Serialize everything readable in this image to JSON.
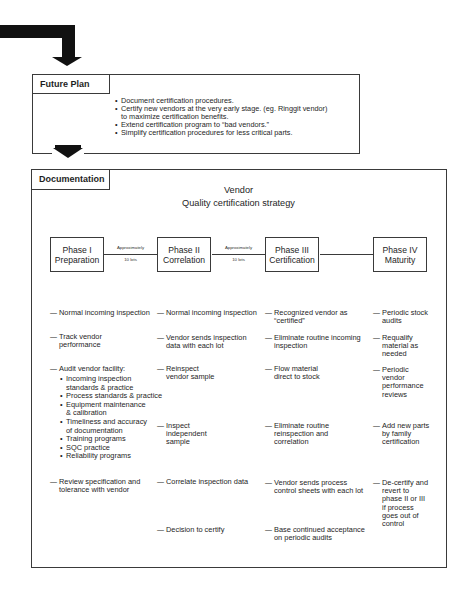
{
  "future_plan": {
    "label": "Future Plan",
    "bullets": [
      "Document certification procedures.",
      "Certify new vendors at the very early stage. (eg. Ringgit vendor)\nto maximize certification benefits.",
      "Extend certification program to “bad vendors.”",
      "Simplify certification procedures for less critical parts."
    ]
  },
  "documentation": {
    "label": "Documentation",
    "title_line1": "Vendor",
    "title_line2": "Quality certification strategy",
    "phases": [
      {
        "name": "Phase I",
        "subtitle": "Preparation"
      },
      {
        "name": "Phase II",
        "subtitle": "Correlation"
      },
      {
        "name": "Phase III",
        "subtitle": "Certification"
      },
      {
        "name": "Phase IV",
        "subtitle": "Maturity"
      }
    ],
    "transitions": [
      {
        "top": "Approximately",
        "bottom": "10 lots"
      },
      {
        "top": "Approximately",
        "bottom": "10 lots"
      }
    ],
    "columns": {
      "phase1": {
        "items": [
          "Normal incoming inspection",
          "Track vendor\nperformance",
          "Audit vendor facility:",
          "Review specification and\ntolerance with vendor"
        ],
        "audit_subitems": [
          "Incoming inspection\nstandards & practice",
          "Process standards & practice",
          "Equipment maintenance\n& calibration",
          "Timeliness and accuracy\nof documentation",
          "Training programs",
          "SQC practice",
          "Reliability programs"
        ]
      },
      "phase2": {
        "items": [
          "Normal incoming inspection",
          "Vendor sends inspection\ndata with each lot",
          "Reinspect\nvendor sample",
          "Inspect\nindependent\nsample",
          "Correlate inspection data",
          "Decision to certify"
        ]
      },
      "phase3": {
        "items": [
          "Recognized vendor as\n“certified”",
          "Eliminate routine incoming\ninspection",
          "Flow material\ndirect to stock",
          "Eliminate routine\nreinspection and\ncorrelation",
          "Vendor sends process\ncontrol sheets with each lot",
          "Base continued acceptance\non periodic audits"
        ]
      },
      "phase4": {
        "items": [
          "Periodic stock\naudits",
          "Requalify\nmaterial as\nneeded",
          "Periodic\nvendor\nperformance\nreviews",
          "Add new parts\nby family\ncertification",
          "De-certify and\nrevert to\nphase II or III\nif process\ngoes out of\ncontrol"
        ]
      }
    }
  },
  "icons": {
    "top_arrow": "flow-arrow-down",
    "middle_arrow": "flow-arrow-down"
  }
}
